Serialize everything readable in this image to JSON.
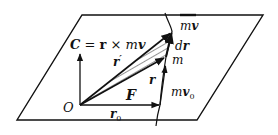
{
  "diagram": {
    "labels": {
      "C_eq": {
        "C": "C",
        "eq": " = ",
        "r": "r",
        "times": " × ",
        "m": "m",
        "v": "v"
      },
      "r_prime": {
        "r": "r",
        "prime": "′"
      },
      "r": "r",
      "F": "F",
      "O": "O",
      "r0": {
        "r": "r",
        "sub": "0"
      },
      "mv": {
        "m": "m",
        "v": "v"
      },
      "dr": {
        "d": "d",
        "r": "r"
      },
      "m": "m",
      "mv0": {
        "m": "m",
        "v": "v",
        "sub": "0"
      }
    },
    "colors": {
      "ink": "#111111",
      "background": "#ffffff"
    }
  }
}
